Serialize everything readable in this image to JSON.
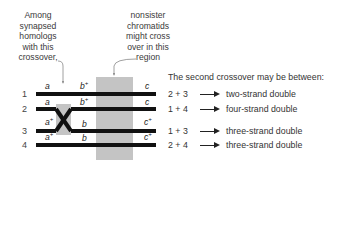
{
  "callouts": {
    "left": "Among synapsed homologs with this crossover,",
    "right": "nonsister chromatids might cross over in this region"
  },
  "chromatids": [
    {
      "number": "1",
      "left_allele": "a",
      "left_sup": "",
      "mid_allele": "b",
      "mid_sup": "+",
      "right_allele": "c",
      "right_sup": ""
    },
    {
      "number": "2",
      "left_allele": "a",
      "left_sup": "",
      "mid_allele": "b",
      "mid_sup": "+",
      "right_allele": "c",
      "right_sup": ""
    },
    {
      "number": "3",
      "left_allele": "a",
      "left_sup": "+",
      "mid_allele": "b",
      "mid_sup": "",
      "right_allele": "c",
      "right_sup": "+"
    },
    {
      "number": "4",
      "left_allele": "a",
      "left_sup": "+",
      "mid_allele": "b",
      "mid_sup": "",
      "right_allele": "c",
      "right_sup": "+"
    }
  ],
  "outcomes": {
    "heading": "The second crossover may be between:",
    "rows": [
      {
        "pair": "2 + 3",
        "result": "two-strand double"
      },
      {
        "pair": "1 + 4",
        "result": "four-strand double"
      },
      {
        "pair": "1 + 3",
        "result": "three-strand double"
      },
      {
        "pair": "2 + 4",
        "result": "three-strand double"
      }
    ]
  },
  "colors": {
    "strand": "#111111",
    "region": "#c4c4c4",
    "text": "#333333"
  }
}
